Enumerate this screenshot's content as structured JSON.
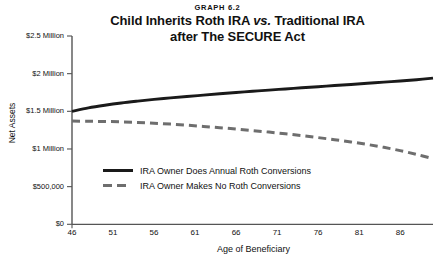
{
  "figure": {
    "graph_number": "GRAPH 6.2",
    "title_line1_a": "Child Inherits Roth IRA ",
    "title_line1_vs": "vs.",
    "title_line1_b": " Traditional IRA",
    "title_line2": "after The SECURE Act"
  },
  "chart_data": {
    "type": "line",
    "title": "Child Inherits Roth IRA vs. Traditional IRA after The SECURE Act",
    "subtitle": "GRAPH 6.2",
    "xlabel": "Age of Beneficiary",
    "ylabel": "Net Assets",
    "xlim": [
      46,
      90
    ],
    "ylim": [
      0,
      2500000
    ],
    "xticks": [
      46,
      51,
      56,
      61,
      66,
      71,
      76,
      81,
      86
    ],
    "yticks": [
      0,
      500000,
      1000000,
      1500000,
      2000000,
      2500000
    ],
    "ytick_labels": [
      "$0",
      "$500,000",
      "$1 Million",
      "$1.5 Million",
      "$2 Million",
      "$2.5 Million"
    ],
    "grid": false,
    "legend_position": "center-left-inside",
    "x": [
      46,
      48,
      50,
      52,
      54,
      56,
      58,
      60,
      62,
      64,
      66,
      68,
      70,
      72,
      74,
      76,
      78,
      80,
      82,
      84,
      86,
      88,
      90
    ],
    "series": [
      {
        "name": "IRA Owner Does Annual Roth Conversions",
        "style": "solid",
        "color": "#1a1a1a",
        "values": [
          1500000,
          1545000,
          1580000,
          1610000,
          1635000,
          1658000,
          1678000,
          1697000,
          1715000,
          1733000,
          1750000,
          1766000,
          1782000,
          1797000,
          1812000,
          1827000,
          1842000,
          1857000,
          1872000,
          1888000,
          1903000,
          1920000,
          1940000
        ]
      },
      {
        "name": "IRA Owner Makes No Roth Conversions",
        "style": "dashed",
        "color": "#6e6e6e",
        "values": [
          1370000,
          1368000,
          1365000,
          1360000,
          1352000,
          1342000,
          1330000,
          1316000,
          1300000,
          1283000,
          1265000,
          1245000,
          1224000,
          1201000,
          1177000,
          1151000,
          1123000,
          1093000,
          1060000,
          1022000,
          978000,
          928000,
          872000
        ]
      }
    ]
  }
}
